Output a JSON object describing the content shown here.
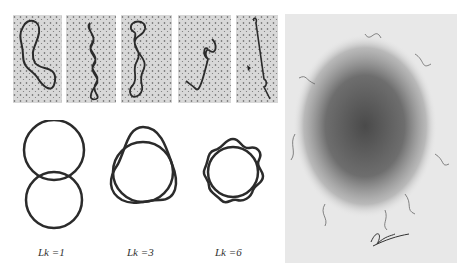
{
  "figure": {
    "header_caption": "",
    "micrographs": [
      {
        "id": "relaxed",
        "description": "open relaxed circular DNA loop"
      },
      {
        "id": "twisted-1",
        "description": "interwound supercoiled DNA"
      },
      {
        "id": "twisted-2",
        "description": "interwound supercoiled DNA with loop"
      },
      {
        "id": "twisted-3",
        "description": "compact supercoiled DNA"
      },
      {
        "id": "twisted-4",
        "description": "highly supercoiled linear-appearing DNA"
      }
    ],
    "diagrams": [
      {
        "label": "Lk =1",
        "lobes": 1
      },
      {
        "label": "Lk =3",
        "lobes": 3
      },
      {
        "label": "Lk =6",
        "lobes": 6
      }
    ],
    "right_panel": {
      "description": "electron micrograph of chromosome with DNA loops radiating from a central scaffold"
    },
    "colors": {
      "line": "#2b2b2b",
      "micro_bg": "#d6d6d6",
      "panel_bg": "#e6e6e6"
    }
  }
}
